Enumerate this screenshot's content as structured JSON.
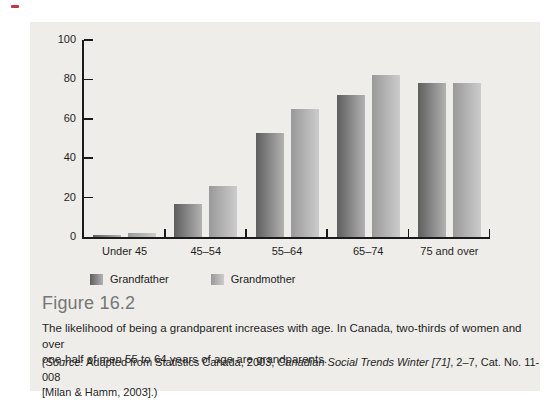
{
  "figure": {
    "label": "Figure 16.2",
    "caption_lines": [
      "The likelihood of being a grandparent increases with age. In Canada, two-thirds of women and over",
      "one-half of men 55 to 64 years of age are grandparents."
    ],
    "source": {
      "part1_italic": "(Source:",
      "part2": " Adapted from Statistics Canada, 2003, ",
      "part3_italic": "Canadian Social Trends Winter [71]",
      "part4": ", 2–7, Cat. No. 11-008",
      "line2": "[Milan & Hamm, 2003].)"
    }
  },
  "chart_data": {
    "type": "bar",
    "categories": [
      "Under 45",
      "45–54",
      "55–64",
      "65–74",
      "75 and over"
    ],
    "series": [
      {
        "name": "Grandfather",
        "values": [
          1,
          17,
          53,
          72,
          78
        ],
        "color_start": "#5e5e5e",
        "color_end": "#b2b2b2"
      },
      {
        "name": "Grandmother",
        "values": [
          2,
          26,
          65,
          82,
          78
        ],
        "color_start": "#999999",
        "color_end": "#cccccc"
      }
    ],
    "title": "",
    "xlabel": "",
    "ylabel": "",
    "ylim": [
      0,
      100
    ],
    "yticks": [
      0,
      20,
      40,
      60,
      80,
      100
    ],
    "grid": false,
    "legend_position": "bottom-left"
  },
  "colors": {
    "panel_bg": "#eeede9",
    "axis": "#1a1a1a",
    "figure_label": "#767676",
    "text": "#1f1f1f",
    "accent_mark": "#bc3a3e"
  }
}
